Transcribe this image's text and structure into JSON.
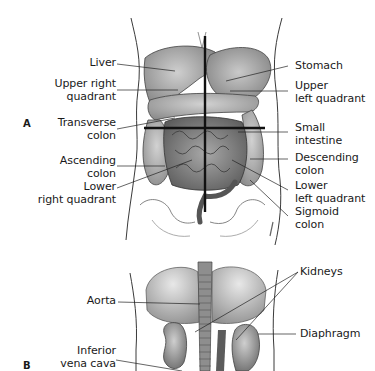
{
  "figure": {
    "panel_a": {
      "letter": "A",
      "left_labels": [
        {
          "id": "liver",
          "text": "Liver"
        },
        {
          "id": "upper-right-quadrant",
          "line1": "Upper right",
          "line2": "quadrant"
        },
        {
          "id": "transverse-colon",
          "line1": "Transverse",
          "line2": "colon"
        },
        {
          "id": "ascending-colon",
          "line1": "Ascending",
          "line2": "colon"
        },
        {
          "id": "lower-right-quadrant",
          "line1": "Lower",
          "line2": "right quadrant"
        }
      ],
      "right_labels": [
        {
          "id": "stomach",
          "text": "Stomach"
        },
        {
          "id": "upper-left-quadrant",
          "line1": "Upper",
          "line2": "left quadrant"
        },
        {
          "id": "small-intestine",
          "line1": "Small",
          "line2": "intestine"
        },
        {
          "id": "descending-colon",
          "line1": "Descending",
          "line2": "colon"
        },
        {
          "id": "lower-left-quadrant",
          "line1": "Lower",
          "line2": "left quadrant"
        },
        {
          "id": "sigmoid-colon",
          "line1": "Sigmoid",
          "line2": "colon"
        }
      ]
    },
    "panel_b": {
      "letter": "B",
      "left_labels": [
        {
          "id": "aorta",
          "text": "Aorta"
        },
        {
          "id": "inferior-vena-cava",
          "line1": "Inferior",
          "line2": "vena cava"
        }
      ],
      "right_labels": [
        {
          "id": "kidneys",
          "text": "Kidneys"
        },
        {
          "id": "diaphragm",
          "text": "Diaphragm"
        }
      ]
    },
    "colors": {
      "ink": "#1a1a1a",
      "organ_dark": "#6e6e6e",
      "organ_mid": "#9a9a9a",
      "organ_light": "#c4c4c4",
      "outline": "#3a3a3a"
    }
  }
}
